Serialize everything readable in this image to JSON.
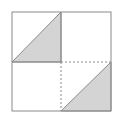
{
  "diagram": {
    "colors": {
      "background": "#ffffff",
      "stroke": "#8a8a8a",
      "fill": "#d4d4d4"
    },
    "outer_square": {
      "x": 12,
      "y": 12,
      "size": 99
    },
    "dividers": {
      "vertical_solid": "top half",
      "vertical_dashed": "bottom half",
      "horizontal_solid": "left half",
      "horizontal_dashed": "right half"
    },
    "shaded_triangles": [
      {
        "quadrant": "top-left"
      },
      {
        "quadrant": "bottom-right"
      }
    ]
  }
}
